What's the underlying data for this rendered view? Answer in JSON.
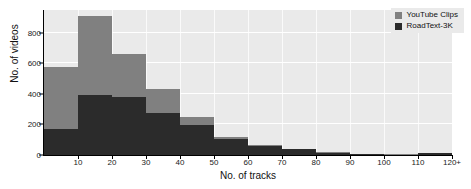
{
  "chart_data": {
    "type": "bar",
    "title": "",
    "subtitle": "",
    "xlabel": "No. of tracks",
    "ylabel": "No. of videos",
    "xlim": [
      0,
      120
    ],
    "ylim": [
      0,
      950
    ],
    "grid": true,
    "stacked_overlay": true,
    "legend_position": "top-right",
    "bin_width": 10,
    "categories": [
      "0-10",
      "10-20",
      "20-30",
      "30-40",
      "40-50",
      "50-60",
      "60-70",
      "70-80",
      "80-90",
      "90-100",
      "100-110",
      "110-120+"
    ],
    "bin_starts": [
      0,
      10,
      20,
      30,
      40,
      50,
      60,
      70,
      80,
      90,
      100,
      110
    ],
    "xtick_labels": [
      "10",
      "20",
      "30",
      "40",
      "50",
      "60",
      "70",
      "80",
      "90",
      "100",
      "110",
      "120+"
    ],
    "xtick_values": [
      10,
      20,
      30,
      40,
      50,
      60,
      70,
      80,
      90,
      100,
      110,
      120
    ],
    "ytick_labels": [
      "0",
      "200",
      "400",
      "600",
      "800"
    ],
    "ytick_values": [
      0,
      200,
      400,
      600,
      800
    ],
    "series": [
      {
        "name": "YouTube Clips",
        "color": "#808080",
        "values": [
          575,
          910,
          665,
          430,
          250,
          120,
          65,
          40,
          18,
          8,
          4,
          12
        ]
      },
      {
        "name": "RoadText-3K",
        "color": "#2b2b2b",
        "values": [
          170,
          395,
          380,
          275,
          195,
          105,
          62,
          38,
          16,
          7,
          3,
          11
        ]
      }
    ]
  },
  "legend": {
    "items": [
      {
        "label": "YouTube Clips",
        "color": "#808080"
      },
      {
        "label": "RoadText-3K",
        "color": "#2b2b2b"
      }
    ]
  },
  "axes": {
    "x_title": "No. of tracks",
    "y_title": "No. of videos"
  }
}
